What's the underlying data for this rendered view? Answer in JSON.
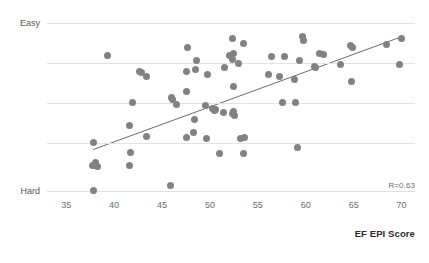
{
  "title_partial": "",
  "chart_data": {
    "type": "scatter",
    "title": "",
    "xlabel": "EF EPI Score",
    "ylabel": "",
    "xlim": [
      33.0,
      71.4
    ],
    "ylim": [
      0,
      100
    ],
    "xticks": [
      35,
      40,
      45,
      50,
      55,
      60,
      65,
      70
    ],
    "ytick_labels": [
      {
        "label": "Easy",
        "value": 95
      },
      {
        "label": "Hard",
        "value": 3
      }
    ],
    "gridlines_y": [
      95,
      73,
      51,
      29,
      3
    ],
    "grid": true,
    "legend": false,
    "annotation": "R=0.63",
    "correlation": 0.63,
    "marker_color": "#828285",
    "trendline_color": "#6b6b6e",
    "grid_color": "#e3e3e3",
    "trendline": {
      "x0": 37.8,
      "y0": 25.5,
      "x1": 70.0,
      "y1": 87.5
    },
    "points": [
      {
        "x": 37.8,
        "y": 3.0
      },
      {
        "x": 37.7,
        "y": 17.0
      },
      {
        "x": 38.0,
        "y": 16.5
      },
      {
        "x": 38.3,
        "y": 16.0
      },
      {
        "x": 38.1,
        "y": 18.5
      },
      {
        "x": 37.9,
        "y": 29.5
      },
      {
        "x": 39.3,
        "y": 77.0
      },
      {
        "x": 41.6,
        "y": 16.5
      },
      {
        "x": 41.7,
        "y": 24.0
      },
      {
        "x": 41.6,
        "y": 38.5
      },
      {
        "x": 41.9,
        "y": 51.5
      },
      {
        "x": 42.6,
        "y": 68.5
      },
      {
        "x": 42.9,
        "y": 68.0
      },
      {
        "x": 43.4,
        "y": 65.5
      },
      {
        "x": 43.4,
        "y": 32.5
      },
      {
        "x": 45.9,
        "y": 5.5
      },
      {
        "x": 46.0,
        "y": 54.0
      },
      {
        "x": 46.1,
        "y": 53.0
      },
      {
        "x": 46.5,
        "y": 50.5
      },
      {
        "x": 47.6,
        "y": 32.0
      },
      {
        "x": 47.6,
        "y": 57.5
      },
      {
        "x": 47.6,
        "y": 68.5
      },
      {
        "x": 47.7,
        "y": 81.5
      },
      {
        "x": 48.4,
        "y": 42.0
      },
      {
        "x": 48.3,
        "y": 35.0
      },
      {
        "x": 48.5,
        "y": 69.5
      },
      {
        "x": 48.6,
        "y": 74.5
      },
      {
        "x": 49.6,
        "y": 31.5
      },
      {
        "x": 49.5,
        "y": 50.0
      },
      {
        "x": 49.7,
        "y": 66.5
      },
      {
        "x": 50.3,
        "y": 48.0
      },
      {
        "x": 50.5,
        "y": 47.0
      },
      {
        "x": 50.6,
        "y": 47.5
      },
      {
        "x": 51.0,
        "y": 23.5
      },
      {
        "x": 51.4,
        "y": 46.0
      },
      {
        "x": 51.5,
        "y": 70.5
      },
      {
        "x": 52.0,
        "y": 77.0
      },
      {
        "x": 52.4,
        "y": 45.5
      },
      {
        "x": 52.6,
        "y": 44.5
      },
      {
        "x": 52.5,
        "y": 46.5
      },
      {
        "x": 52.5,
        "y": 60.0
      },
      {
        "x": 52.4,
        "y": 75.0
      },
      {
        "x": 52.5,
        "y": 78.5
      },
      {
        "x": 52.4,
        "y": 86.5
      },
      {
        "x": 53.2,
        "y": 31.5
      },
      {
        "x": 53.5,
        "y": 23.5
      },
      {
        "x": 53.6,
        "y": 32.0
      },
      {
        "x": 53.0,
        "y": 73.0
      },
      {
        "x": 53.5,
        "y": 84.0
      },
      {
        "x": 56.1,
        "y": 66.5
      },
      {
        "x": 56.4,
        "y": 76.5
      },
      {
        "x": 57.3,
        "y": 65.5
      },
      {
        "x": 57.6,
        "y": 51.5
      },
      {
        "x": 57.8,
        "y": 76.5
      },
      {
        "x": 58.8,
        "y": 64.0
      },
      {
        "x": 58.9,
        "y": 51.5
      },
      {
        "x": 59.1,
        "y": 26.5
      },
      {
        "x": 59.3,
        "y": 74.5
      },
      {
        "x": 59.7,
        "y": 87.5
      },
      {
        "x": 59.8,
        "y": 85.5
      },
      {
        "x": 60.9,
        "y": 71.0
      },
      {
        "x": 61.0,
        "y": 70.5
      },
      {
        "x": 61.4,
        "y": 78.5
      },
      {
        "x": 61.8,
        "y": 78.0
      },
      {
        "x": 63.6,
        "y": 72.5
      },
      {
        "x": 64.8,
        "y": 63.0
      },
      {
        "x": 64.7,
        "y": 82.5
      },
      {
        "x": 64.9,
        "y": 81.5
      },
      {
        "x": 68.4,
        "y": 83.0
      },
      {
        "x": 69.8,
        "y": 72.5
      },
      {
        "x": 70.0,
        "y": 86.5
      }
    ]
  }
}
